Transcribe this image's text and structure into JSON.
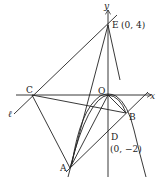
{
  "diagram": {
    "axes": {
      "x_label": "x",
      "y_label": "y"
    },
    "points": {
      "E": {
        "name": "E",
        "coord": "(0, 4)"
      },
      "O": {
        "name": "O"
      },
      "D": {
        "name": "D",
        "coord": "(0, −2)"
      },
      "A": {
        "name": "A"
      },
      "B": {
        "name": "B"
      },
      "C": {
        "name": "C"
      }
    },
    "line_label": "ℓ",
    "colors": {
      "stroke": "#222222",
      "background": "#ffffff"
    }
  }
}
